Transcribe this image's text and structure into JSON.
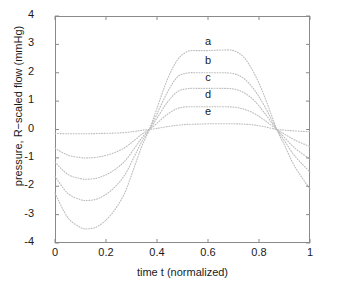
{
  "chart_data": {
    "type": "line",
    "title": "",
    "xlabel": "time t (normalized)",
    "ylabel": "pressure, R−scaled flow (mmHg)",
    "xlim": [
      0,
      1
    ],
    "ylim": [
      -4,
      4
    ],
    "grid": false,
    "legend_position": "inline-right-of-curves",
    "linestyle": "dotted",
    "xticks": [
      0,
      0.2,
      0.4,
      0.6,
      0.8,
      1
    ],
    "xticklabels": [
      "0",
      "0.2",
      "0.4",
      "0.6",
      "0.8",
      "1"
    ],
    "yticks": [
      -4,
      -3,
      -2,
      -1,
      0,
      1,
      2,
      3,
      4
    ],
    "yticklabels": [
      "-4",
      "-3",
      "-2",
      "-1",
      "0",
      "1",
      "2",
      "3",
      "4"
    ],
    "x": [
      0,
      0.05,
      0.1,
      0.13,
      0.17,
      0.22,
      0.27,
      0.31,
      0.34,
      0.37,
      0.4,
      0.44,
      0.48,
      0.52,
      0.56,
      0.6,
      0.65,
      0.7,
      0.74,
      0.78,
      0.82,
      0.87,
      0.9,
      0.94,
      1
    ],
    "series": [
      {
        "name": "a",
        "label": "a",
        "peak": 2.8,
        "trough": -3.5,
        "values": [
          -2.25,
          -3.1,
          -3.45,
          -3.5,
          -3.4,
          -3.0,
          -2.3,
          -1.35,
          -0.6,
          0.0,
          0.75,
          1.75,
          2.45,
          2.75,
          2.78,
          2.78,
          2.8,
          2.78,
          2.55,
          2.0,
          1.2,
          0.0,
          -0.55,
          -1.3,
          -2.1
        ]
      },
      {
        "name": "b",
        "label": "b",
        "peak": 2.0,
        "trough": -2.5,
        "values": [
          -1.65,
          -2.25,
          -2.47,
          -2.5,
          -2.43,
          -2.15,
          -1.65,
          -0.97,
          -0.43,
          0.0,
          0.55,
          1.3,
          1.85,
          1.99,
          2.0,
          2.0,
          2.0,
          1.97,
          1.8,
          1.42,
          0.85,
          0.0,
          -0.4,
          -0.93,
          -1.5
        ]
      },
      {
        "name": "c",
        "label": "c",
        "peak": 1.45,
        "trough": -1.75,
        "values": [
          -1.15,
          -1.58,
          -1.73,
          -1.75,
          -1.7,
          -1.5,
          -1.15,
          -0.68,
          -0.3,
          0.0,
          0.4,
          0.95,
          1.33,
          1.44,
          1.45,
          1.45,
          1.45,
          1.43,
          1.3,
          1.03,
          0.6,
          0.0,
          -0.28,
          -0.65,
          -1.05
        ]
      },
      {
        "name": "d",
        "label": "d",
        "peak": 0.8,
        "trough": -1.0,
        "values": [
          -0.66,
          -0.9,
          -0.99,
          -1.0,
          -0.97,
          -0.86,
          -0.66,
          -0.39,
          -0.17,
          0.0,
          0.22,
          0.53,
          0.74,
          0.8,
          0.8,
          0.8,
          0.8,
          0.79,
          0.72,
          0.57,
          0.34,
          0.0,
          -0.16,
          -0.37,
          -0.6
        ]
      },
      {
        "name": "e",
        "label": "e",
        "peak": 0.2,
        "trough": -0.15,
        "values": [
          -0.14,
          -0.15,
          -0.15,
          -0.15,
          -0.14,
          -0.13,
          -0.11,
          -0.07,
          -0.03,
          0.0,
          0.04,
          0.1,
          0.15,
          0.18,
          0.19,
          0.2,
          0.2,
          0.2,
          0.19,
          0.16,
          0.1,
          0.0,
          -0.02,
          -0.05,
          -0.08
        ]
      }
    ],
    "series_labels": [
      {
        "name": "a",
        "x_frac": 0.6,
        "y_value": 3.05
      },
      {
        "name": "b",
        "x_frac": 0.6,
        "y_value": 2.38
      },
      {
        "name": "c",
        "x_frac": 0.6,
        "y_value": 1.78
      },
      {
        "name": "d",
        "x_frac": 0.6,
        "y_value": 1.18
      },
      {
        "name": "e",
        "x_frac": 0.6,
        "y_value": 0.58
      }
    ],
    "colors": {
      "curve": "#bdbdbd",
      "axis": "#8a8a8a",
      "text": "#1a1a1a"
    }
  }
}
